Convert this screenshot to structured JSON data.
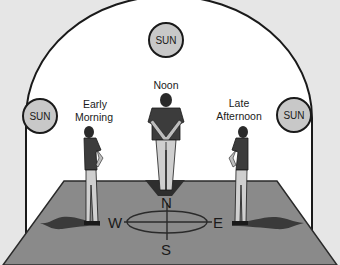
{
  "diagram": {
    "type": "sun-position-shadow-illustration",
    "suns": [
      {
        "id": "east-sun",
        "label": "SUN",
        "position": "left"
      },
      {
        "id": "noon-sun",
        "label": "SUN",
        "position": "top"
      },
      {
        "id": "west-sun",
        "label": "SUN",
        "position": "right"
      }
    ],
    "figures": [
      {
        "id": "early-morning",
        "label_line1": "Early",
        "label_line2": "Morning"
      },
      {
        "id": "noon",
        "label_line1": "Noon"
      },
      {
        "id": "late-afternoon",
        "label_line1": "Late",
        "label_line2": "Afternoon"
      }
    ],
    "compass": {
      "north": "N",
      "south": "S",
      "east": "E",
      "west": "W"
    },
    "colors": {
      "background": "#e6e6e6",
      "arc_fill": "#ffffff",
      "sun_fill": "#c8c8c8",
      "ground": "#8a8a8a",
      "shadow": "#3a3a3a",
      "shirt": "#3c3c3c",
      "pants": "#cfcfcf"
    }
  }
}
